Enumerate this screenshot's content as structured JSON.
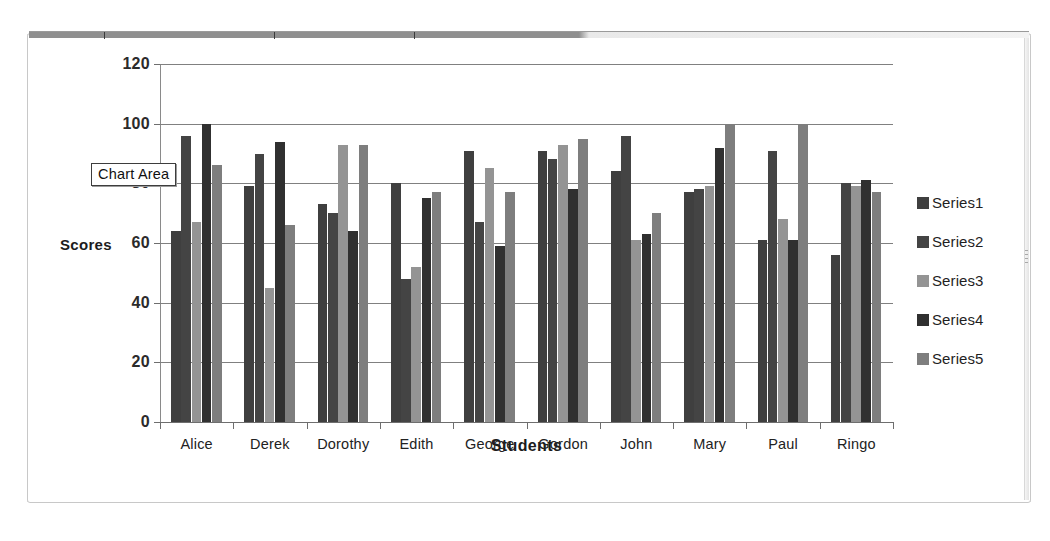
{
  "page": {
    "top_caption": "",
    "bottom_caption": ""
  },
  "tooltip": {
    "label": "Chart Area"
  },
  "legend": {
    "position": "right",
    "items": [
      {
        "label": "Series1",
        "color": "#3f3f3f"
      },
      {
        "label": "Series2",
        "color": "#444444"
      },
      {
        "label": "Series3",
        "color": "#949494"
      },
      {
        "label": "Series4",
        "color": "#303030"
      },
      {
        "label": "Series5",
        "color": "#7e7e7e"
      }
    ]
  },
  "chart_data": {
    "type": "bar",
    "title": "",
    "xlabel": "Students",
    "ylabel": "Scores",
    "ylim": [
      0,
      120
    ],
    "yticks": [
      0,
      20,
      40,
      60,
      80,
      100,
      120
    ],
    "ytick_labels": [
      "0",
      "20",
      "40",
      "60",
      "80",
      "100",
      "120"
    ],
    "grid": true,
    "legend_position": "right",
    "categories": [
      "Alice",
      "Derek",
      "Dorothy",
      "Edith",
      "George",
      "Gordon",
      "John",
      "Mary",
      "Paul",
      "Ringo"
    ],
    "series": [
      {
        "name": "Series1",
        "color": "#3f3f3f",
        "values": [
          64,
          79,
          73,
          80,
          91,
          91,
          84,
          77,
          61,
          56
        ]
      },
      {
        "name": "Series2",
        "color": "#444444",
        "values": [
          96,
          90,
          70,
          48,
          67,
          88,
          96,
          78,
          91,
          80
        ]
      },
      {
        "name": "Series3",
        "color": "#949494",
        "values": [
          67,
          45,
          93,
          52,
          85,
          93,
          61,
          79,
          68,
          79
        ]
      },
      {
        "name": "Series4",
        "color": "#303030",
        "values": [
          100,
          94,
          64,
          75,
          59,
          78,
          63,
          92,
          61,
          81
        ]
      },
      {
        "name": "Series5",
        "color": "#7e7e7e",
        "values": [
          86,
          66,
          93,
          77,
          77,
          95,
          70,
          100,
          100,
          77
        ]
      }
    ]
  }
}
